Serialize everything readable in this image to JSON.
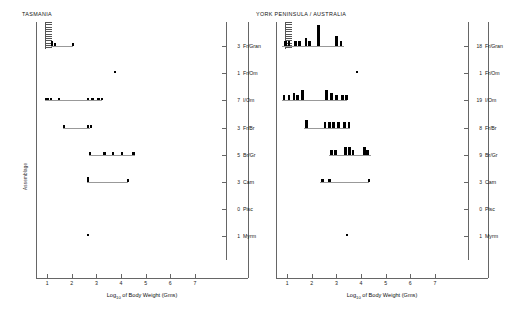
{
  "figure": {
    "xaxis": {
      "title": "Log",
      "title_sub": "10",
      "title_rest": " of Body Weight (Gms)",
      "ticks": [
        "1",
        "2",
        "3",
        "4",
        "5",
        "6",
        "7"
      ],
      "min": 0.55,
      "max": 7.45
    },
    "yaxis": {
      "title": "Assemblage"
    },
    "guilds": [
      {
        "label": "Fr/Gran",
        "key": "fr_gran"
      },
      {
        "label": "Fr/Om",
        "key": "fr_om"
      },
      {
        "label": "I/Om",
        "key": "i_om"
      },
      {
        "label": "Fr/Br",
        "key": "fr_br"
      },
      {
        "label": "Br/Gr",
        "key": "br_gr"
      },
      {
        "label": "Carn",
        "key": "carn"
      },
      {
        "label": "Pisc",
        "key": "pisc"
      },
      {
        "label": "Myrm",
        "key": "myrm"
      }
    ]
  },
  "panels": [
    {
      "id": "panel-left",
      "title": "TASMANIA",
      "counts": [
        "3",
        "1",
        "7",
        "3",
        "5",
        "3",
        "0",
        "1"
      ],
      "rows": [
        {
          "guild": "Fr/Gran",
          "count": 3,
          "span": [
            1.15,
            2.05
          ],
          "bars": [
            {
              "x": 1.15,
              "h": 2,
              "w": 0.11
            },
            {
              "x": 1.28,
              "h": 1,
              "w": 0.08
            },
            {
              "x": 2.02,
              "h": 1,
              "w": 0.08
            }
          ]
        },
        {
          "guild": "Fr/Om",
          "count": 1,
          "span": null,
          "bars": [
            {
              "x": 3.72,
              "h": 1,
              "w": 0.08
            }
          ]
        },
        {
          "guild": "I/Om",
          "count": 7,
          "span": [
            0.92,
            3.22
          ],
          "bars": [
            {
              "x": 0.92,
              "h": 1,
              "w": 0.14
            },
            {
              "x": 1.12,
              "h": 1,
              "w": 0.09
            },
            {
              "x": 1.46,
              "h": 1,
              "w": 0.08
            },
            {
              "x": 2.62,
              "h": 1,
              "w": 0.09
            },
            {
              "x": 2.8,
              "h": 1,
              "w": 0.09
            },
            {
              "x": 3.02,
              "h": 1,
              "w": 0.14
            },
            {
              "x": 3.2,
              "h": 1,
              "w": 0.09
            }
          ]
        },
        {
          "guild": "Fr/Br",
          "count": 3,
          "span": [
            1.65,
            2.75
          ],
          "bars": [
            {
              "x": 1.65,
              "h": 1,
              "w": 0.09
            },
            {
              "x": 2.62,
              "h": 1,
              "w": 0.09
            },
            {
              "x": 2.73,
              "h": 1,
              "w": 0.09
            }
          ]
        },
        {
          "guild": "Br/Gr",
          "count": 5,
          "span": [
            2.7,
            4.55
          ],
          "bars": [
            {
              "x": 2.7,
              "h": 1,
              "w": 0.1
            },
            {
              "x": 3.28,
              "h": 1,
              "w": 0.1
            },
            {
              "x": 3.62,
              "h": 1,
              "w": 0.1
            },
            {
              "x": 3.98,
              "h": 1,
              "w": 0.1
            },
            {
              "x": 4.46,
              "h": 1,
              "w": 0.1
            }
          ]
        },
        {
          "guild": "Carn",
          "count": 3,
          "span": [
            2.62,
            4.3
          ],
          "bars": [
            {
              "x": 2.62,
              "h": 2,
              "w": 0.1
            },
            {
              "x": 4.25,
              "h": 1,
              "w": 0.09
            }
          ]
        },
        {
          "guild": "Pisc",
          "count": 0,
          "span": null,
          "bars": []
        },
        {
          "guild": "Myrm",
          "count": 1,
          "span": null,
          "bars": [
            {
              "x": 2.62,
              "h": 1,
              "w": 0.09
            }
          ]
        }
      ]
    },
    {
      "id": "panel-right",
      "title": "YORK PENINSULA / AUSTRALIA",
      "counts": [
        "18",
        "1",
        "19",
        "8",
        "9",
        "3",
        "0",
        "1"
      ],
      "rows": [
        {
          "guild": "Fr/Gran",
          "count": 18,
          "span": [
            0.8,
            3.3
          ],
          "bars": [
            {
              "x": 0.88,
              "h": 2,
              "w": 0.1
            },
            {
              "x": 1.02,
              "h": 2,
              "w": 0.1
            },
            {
              "x": 1.3,
              "h": 2,
              "w": 0.1
            },
            {
              "x": 1.45,
              "h": 2,
              "w": 0.1
            },
            {
              "x": 1.72,
              "h": 3,
              "w": 0.1
            },
            {
              "x": 1.86,
              "h": 2,
              "w": 0.1
            },
            {
              "x": 2.22,
              "h": 8,
              "w": 0.11
            },
            {
              "x": 2.95,
              "h": 4,
              "w": 0.11
            },
            {
              "x": 3.14,
              "h": 2,
              "w": 0.1
            }
          ]
        },
        {
          "guild": "Fr/Om",
          "count": 1,
          "span": null,
          "bars": [
            {
              "x": 3.78,
              "h": 1,
              "w": 0.09
            }
          ]
        },
        {
          "guild": "I/Om",
          "count": 19,
          "span": [
            0.78,
            3.45
          ],
          "bars": [
            {
              "x": 0.82,
              "h": 2,
              "w": 0.11
            },
            {
              "x": 1.02,
              "h": 2,
              "w": 0.11
            },
            {
              "x": 1.22,
              "h": 3,
              "w": 0.11
            },
            {
              "x": 1.38,
              "h": 2,
              "w": 0.11
            },
            {
              "x": 1.56,
              "h": 4,
              "w": 0.11
            },
            {
              "x": 2.55,
              "h": 4,
              "w": 0.12
            },
            {
              "x": 2.74,
              "h": 3,
              "w": 0.12
            },
            {
              "x": 2.95,
              "h": 2,
              "w": 0.12
            },
            {
              "x": 3.18,
              "h": 2,
              "w": 0.12
            },
            {
              "x": 3.34,
              "h": 2,
              "w": 0.12
            }
          ]
        },
        {
          "guild": "Fr/Br",
          "count": 8,
          "span": [
            1.7,
            3.55
          ],
          "bars": [
            {
              "x": 1.72,
              "h": 3,
              "w": 0.11
            },
            {
              "x": 2.48,
              "h": 2,
              "w": 0.11
            },
            {
              "x": 2.66,
              "h": 2,
              "w": 0.11
            },
            {
              "x": 2.84,
              "h": 2,
              "w": 0.11
            },
            {
              "x": 3.04,
              "h": 2,
              "w": 0.11
            },
            {
              "x": 3.28,
              "h": 2,
              "w": 0.11
            },
            {
              "x": 3.46,
              "h": 2,
              "w": 0.11
            }
          ]
        },
        {
          "guild": "Br/Gr",
          "count": 9,
          "span": [
            2.7,
            4.4
          ],
          "bars": [
            {
              "x": 2.74,
              "h": 2,
              "w": 0.11
            },
            {
              "x": 2.92,
              "h": 2,
              "w": 0.11
            },
            {
              "x": 3.32,
              "h": 3,
              "w": 0.13
            },
            {
              "x": 3.48,
              "h": 3,
              "w": 0.13
            },
            {
              "x": 3.62,
              "h": 2,
              "w": 0.11
            },
            {
              "x": 4.08,
              "h": 3,
              "w": 0.11
            },
            {
              "x": 4.22,
              "h": 2,
              "w": 0.11
            }
          ]
        },
        {
          "guild": "Carn",
          "count": 3,
          "span": [
            2.35,
            4.32
          ],
          "bars": [
            {
              "x": 2.38,
              "h": 1,
              "w": 0.1
            },
            {
              "x": 2.68,
              "h": 1,
              "w": 0.1
            },
            {
              "x": 4.28,
              "h": 1,
              "w": 0.1
            }
          ]
        },
        {
          "guild": "Pisc",
          "count": 0,
          "span": null,
          "bars": []
        },
        {
          "guild": "Myrm",
          "count": 1,
          "span": null,
          "bars": [
            {
              "x": 3.38,
              "h": 1,
              "w": 0.09
            }
          ]
        }
      ]
    }
  ],
  "chart_data": {
    "type": "bar",
    "xlabel": "Log10 of Body Weight (Gms)",
    "ylabel": "Assemblage",
    "xlim": [
      0.55,
      7.45
    ],
    "xticks": [
      1,
      2,
      3,
      4,
      5,
      6,
      7
    ],
    "grid": false,
    "legend": "none",
    "panels": [
      {
        "name": "TASMANIA",
        "guilds": [
          "Fr/Gran",
          "Fr/Om",
          "I/Om",
          "Fr/Br",
          "Br/Gr",
          "Carn",
          "Pisc",
          "Myrm"
        ],
        "species_counts": [
          3,
          1,
          7,
          3,
          5,
          3,
          0,
          1
        ],
        "points": {
          "Fr/Gran": [
            1.15,
            1.28,
            2.02
          ],
          "Fr/Om": [
            3.72
          ],
          "I/Om": [
            0.92,
            1.12,
            1.46,
            2.62,
            2.8,
            3.02,
            3.2
          ],
          "Fr/Br": [
            1.65,
            2.62,
            2.73
          ],
          "Br/Gr": [
            2.7,
            3.28,
            3.62,
            3.98,
            4.46
          ],
          "Carn": [
            2.62,
            4.25
          ],
          "Pisc": [],
          "Myrm": [
            2.62
          ]
        }
      },
      {
        "name": "YORK PENINSULA / AUSTRALIA",
        "guilds": [
          "Fr/Gran",
          "Fr/Om",
          "I/Om",
          "Fr/Br",
          "Br/Gr",
          "Carn",
          "Pisc",
          "Myrm"
        ],
        "species_counts": [
          18,
          1,
          19,
          8,
          9,
          3,
          0,
          1
        ],
        "points": {
          "Fr/Gran": [
            0.88,
            1.02,
            1.3,
            1.45,
            1.72,
            1.86,
            2.22,
            2.95,
            3.14
          ],
          "Fr/Om": [
            3.78
          ],
          "I/Om": [
            0.82,
            1.02,
            1.22,
            1.38,
            1.56,
            2.55,
            2.74,
            2.95,
            3.18,
            3.34
          ],
          "Fr/Br": [
            1.72,
            2.48,
            2.66,
            2.84,
            3.04,
            3.28,
            3.46
          ],
          "Br/Gr": [
            2.74,
            2.92,
            3.32,
            3.48,
            3.62,
            4.08,
            4.22
          ],
          "Carn": [
            2.38,
            2.68,
            4.28
          ],
          "Pisc": [],
          "Myrm": [
            3.38
          ]
        }
      }
    ]
  }
}
